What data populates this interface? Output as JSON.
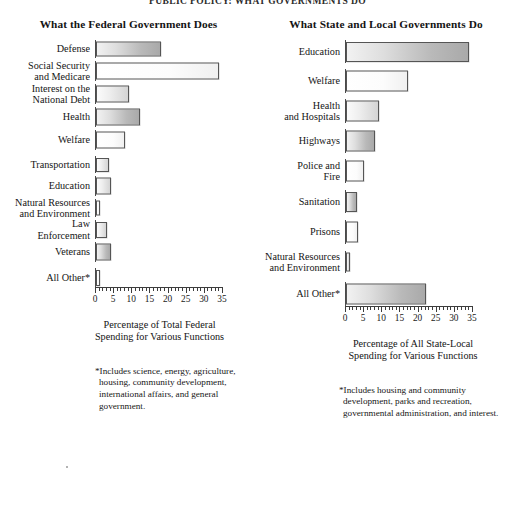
{
  "running_head": "PUBLIC POLICY: WHAT GOVERNMENTS DO",
  "panels": {
    "left": {
      "title": "What the Federal Government Does",
      "axis_title": "Percentage of Total Federal\nSpending for Various Functions",
      "footnote": "*Includes science, energy, agriculture, housing, community development, international affairs, and general government."
    },
    "right": {
      "title": "What State and Local Governments Do",
      "axis_title": "Percentage of All State-Local\nSpending for Various Functions",
      "footnote": "*Includes housing and community development, parks and recreation, governmental administration, and interest."
    }
  },
  "chart_data": [
    {
      "type": "bar",
      "orientation": "horizontal",
      "title": "What the Federal Government Does",
      "xlabel": "Percentage of Total Federal Spending for Various Functions",
      "ylabel": "",
      "xlim": [
        0,
        35
      ],
      "xticks": [
        0,
        5,
        10,
        15,
        20,
        25,
        30,
        35
      ],
      "minor_tick_step": 1,
      "grid": false,
      "legend": "none",
      "categories": [
        "Defense",
        "Social Security and Medicare",
        "Interest on the National Debt",
        "Health",
        "Welfare",
        "Transportation",
        "Education",
        "Natural Resources and Environment",
        "Law Enforcement",
        "Veterans",
        "All Other*"
      ],
      "values": [
        18,
        34,
        9,
        12,
        8,
        3.5,
        4,
        1.2,
        3,
        4,
        1
      ]
    },
    {
      "type": "bar",
      "orientation": "horizontal",
      "title": "What State and Local Governments Do",
      "xlabel": "Percentage of All State-Local Spending for Various Functions",
      "ylabel": "",
      "xlim": [
        0,
        35
      ],
      "xticks": [
        0,
        5,
        10,
        15,
        20,
        25,
        30,
        35
      ],
      "minor_tick_step": 1,
      "grid": false,
      "legend": "none",
      "categories": [
        "Education",
        "Welfare",
        "Health and Hospitals",
        "Highways",
        "Police and Fire",
        "Sanitation",
        "Prisons",
        "Natural Resources and Environment",
        "All Other*"
      ],
      "values": [
        34,
        17,
        9,
        8,
        5,
        3,
        3.3,
        1.2,
        22
      ]
    }
  ],
  "left_rows": [
    {
      "label": "Defense",
      "value": 18,
      "shade": "shade-dark",
      "height": 18,
      "gap": 0
    },
    {
      "label": "Social Security\nand Medicare",
      "value": 34,
      "shade": "shade-light",
      "height": 20,
      "gap": 3
    },
    {
      "label": "Interest on the\nNational Debt",
      "value": 9,
      "shade": "shade-mid",
      "height": 20,
      "gap": 3
    },
    {
      "label": "Health",
      "value": 12,
      "shade": "shade-dark",
      "height": 20,
      "gap": 3
    },
    {
      "label": "Welfare",
      "value": 8,
      "shade": "shade-light",
      "height": 20,
      "gap": 3
    },
    {
      "label": "Transportation",
      "value": 3.5,
      "shade": "shade-mid",
      "height": 17,
      "gap": 6
    },
    {
      "label": "Education",
      "value": 4,
      "shade": "shade-mid",
      "height": 20,
      "gap": 3
    },
    {
      "label": "Natural Resources\nand Environment",
      "value": 1.2,
      "shade": "shade-light",
      "height": 18,
      "gap": 3
    },
    {
      "label": "Law\nEnforcement",
      "value": 3,
      "shade": "shade-mid",
      "height": 19,
      "gap": 3
    },
    {
      "label": "Veterans",
      "value": 4,
      "shade": "shade-dark",
      "height": 20,
      "gap": 3
    },
    {
      "label": "All Other*",
      "value": 1,
      "shade": "shade-light",
      "height": 19,
      "gap": 6
    }
  ],
  "right_rows": [
    {
      "label": "Education",
      "value": 34,
      "shade": "shade-dark",
      "height": 23,
      "gap": 0
    },
    {
      "label": "Welfare",
      "value": 17,
      "shade": "shade-light",
      "height": 24,
      "gap": 6
    },
    {
      "label": "Health\nand Hospitals",
      "value": 9,
      "shade": "shade-mid",
      "height": 24,
      "gap": 6
    },
    {
      "label": "Highways",
      "value": 8,
      "shade": "shade-dark",
      "height": 24,
      "gap": 6
    },
    {
      "label": "Police and\nFire",
      "value": 5,
      "shade": "shade-light",
      "height": 24,
      "gap": 6
    },
    {
      "label": "Sanitation",
      "value": 3,
      "shade": "shade-dark",
      "height": 23,
      "gap": 7
    },
    {
      "label": "Prisons",
      "value": 3.3,
      "shade": "shade-light",
      "height": 24,
      "gap": 7
    },
    {
      "label": "Natural Resources\nand Environment",
      "value": 1.2,
      "shade": "shade-mid",
      "height": 22,
      "gap": 7
    },
    {
      "label": "All Other*",
      "value": 22,
      "shade": "shade-dark",
      "height": 24,
      "gap": 9
    }
  ],
  "axis": {
    "min": 0,
    "max": 35,
    "major_step": 5,
    "minor_step": 1,
    "labels": [
      "0",
      "5",
      "10",
      "15",
      "20",
      "25",
      "30",
      "35"
    ]
  },
  "colors": {
    "ink": "#111111",
    "rule": "#3d3d3d",
    "bar_border": "#555555",
    "paper": "#ffffff"
  }
}
